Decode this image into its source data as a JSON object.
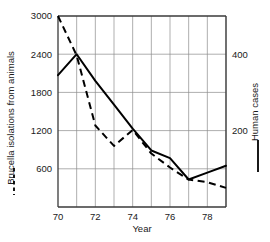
{
  "chart_data": {
    "type": "line",
    "title": "",
    "xlabel": "Year",
    "x": [
      70,
      71,
      72,
      73,
      74,
      75,
      76,
      77,
      78,
      79
    ],
    "xticks": [
      "70",
      "72",
      "74",
      "76",
      "78"
    ],
    "xtick_values": [
      70,
      72,
      74,
      76,
      78
    ],
    "xlim": [
      70,
      79
    ],
    "grid": true,
    "legend_position": "outside-left-and-right",
    "axes": [
      {
        "id": "left",
        "label": "Brucella isolations from animals",
        "ticks": [
          "600",
          "1200",
          "1800",
          "2400",
          "3000"
        ],
        "tick_values": [
          600,
          1200,
          1800,
          2400,
          3000
        ],
        "lim": [
          0,
          3000
        ]
      },
      {
        "id": "right",
        "label": "Human cases",
        "ticks": [
          "200",
          "400"
        ],
        "tick_values": [
          200,
          400
        ],
        "lim": [
          0,
          500
        ]
      }
    ],
    "series": [
      {
        "name": "Brucella isolations from animals",
        "axis": "left",
        "style": "dashed",
        "marker": "dashed-line",
        "values": [
          3000,
          2380,
          1280,
          960,
          1210,
          840,
          620,
          430,
          390,
          300
        ]
      },
      {
        "name": "Human cases",
        "axis": "right",
        "style": "solid",
        "marker": "solid-line",
        "values": [
          345,
          400,
          330,
          268,
          205,
          148,
          128,
          72,
          90,
          108
        ]
      }
    ]
  },
  "legend": {
    "left_entry": "Brucella isolations from animals",
    "right_entry": "Human cases"
  }
}
